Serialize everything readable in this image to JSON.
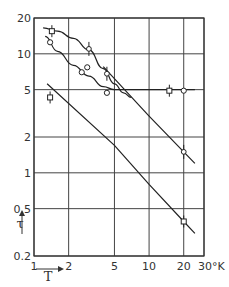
{
  "chart_data": {
    "type": "scatter",
    "title": "",
    "xlabel": "T",
    "xunit": "°K",
    "ylabel": "τ",
    "xscale": "log",
    "yscale": "log",
    "xlim": [
      1,
      30
    ],
    "ylim": [
      0.2,
      20
    ],
    "grid": true,
    "x_ticks": [
      1,
      2,
      5,
      10,
      20,
      30
    ],
    "x_tick_labels": [
      "1",
      "2",
      "5",
      "10",
      "20",
      "30°K"
    ],
    "y_ticks": [
      0.2,
      0.5,
      1,
      2,
      5,
      10,
      20
    ],
    "y_tick_labels": [
      "0.2",
      "0.5",
      "1",
      "2",
      "5",
      "10",
      "20"
    ],
    "series": [
      {
        "name": "upper curve (S-shaped)",
        "kind": "line",
        "points": [
          [
            1.2,
            16.5
          ],
          [
            1.6,
            15.5
          ],
          [
            2.2,
            13.5
          ],
          [
            3.0,
            10.8
          ],
          [
            4.0,
            7.5
          ],
          [
            5.0,
            5.6
          ],
          [
            6.0,
            4.7
          ],
          [
            7.0,
            4.3
          ]
        ],
        "note": "continues as straight falling line"
      },
      {
        "name": "middle curve (levels off at 5)",
        "kind": "line",
        "points": [
          [
            1.25,
            14.0
          ],
          [
            1.6,
            10.5
          ],
          [
            2.2,
            8.0
          ],
          [
            3.0,
            6.5
          ],
          [
            4.0,
            5.3
          ],
          [
            5.0,
            5.0
          ],
          [
            10.0,
            5.0
          ],
          [
            25.0,
            5.0
          ]
        ]
      },
      {
        "name": "upper straight line",
        "kind": "line",
        "points": [
          [
            4.0,
            7.8
          ],
          [
            10.0,
            3.0
          ],
          [
            20.0,
            1.5
          ],
          [
            25.0,
            1.2
          ]
        ]
      },
      {
        "name": "lower straight line",
        "kind": "line",
        "points": [
          [
            1.3,
            5.6
          ],
          [
            5.0,
            1.7
          ],
          [
            10.0,
            0.8
          ],
          [
            20.0,
            0.39
          ],
          [
            25.0,
            0.31
          ]
        ]
      },
      {
        "name": "squares",
        "kind": "markers",
        "marker": "square",
        "points": [
          [
            1.43,
            15.5
          ],
          [
            1.38,
            4.3
          ],
          [
            15.0,
            4.9
          ],
          [
            20.0,
            0.39
          ]
        ]
      },
      {
        "name": "circles",
        "kind": "markers",
        "marker": "circle",
        "points": [
          [
            1.38,
            12.5
          ],
          [
            2.6,
            7.0
          ],
          [
            2.9,
            7.7
          ],
          [
            4.3,
            4.7
          ],
          [
            20.0,
            4.9
          ]
        ]
      },
      {
        "name": "points with error bars",
        "kind": "markers",
        "marker": "circle-with-bar",
        "points": [
          [
            3.0,
            11.0
          ],
          [
            4.3,
            6.8
          ],
          [
            20.0,
            1.5
          ]
        ]
      }
    ]
  }
}
